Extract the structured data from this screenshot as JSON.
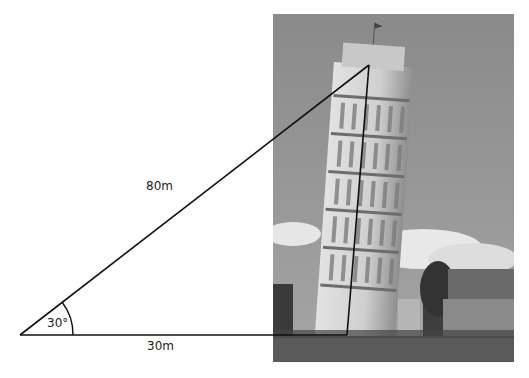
{
  "diagram": {
    "labels": {
      "hypotenuse": "80m",
      "base": "30m",
      "angle": "30°"
    },
    "geometry": {
      "vertex_left": [
        20,
        335
      ],
      "apex": [
        369,
        65
      ],
      "base_foot": [
        347,
        335
      ],
      "arc_radius": 53
    },
    "photo": {
      "subject": "Leaning Tower of Pisa",
      "grayscale": true
    },
    "colors": {
      "line": "#111111",
      "sky": "#8f8f8f",
      "tower": "#d9d9d9",
      "ground": "#5a5a5a"
    }
  }
}
